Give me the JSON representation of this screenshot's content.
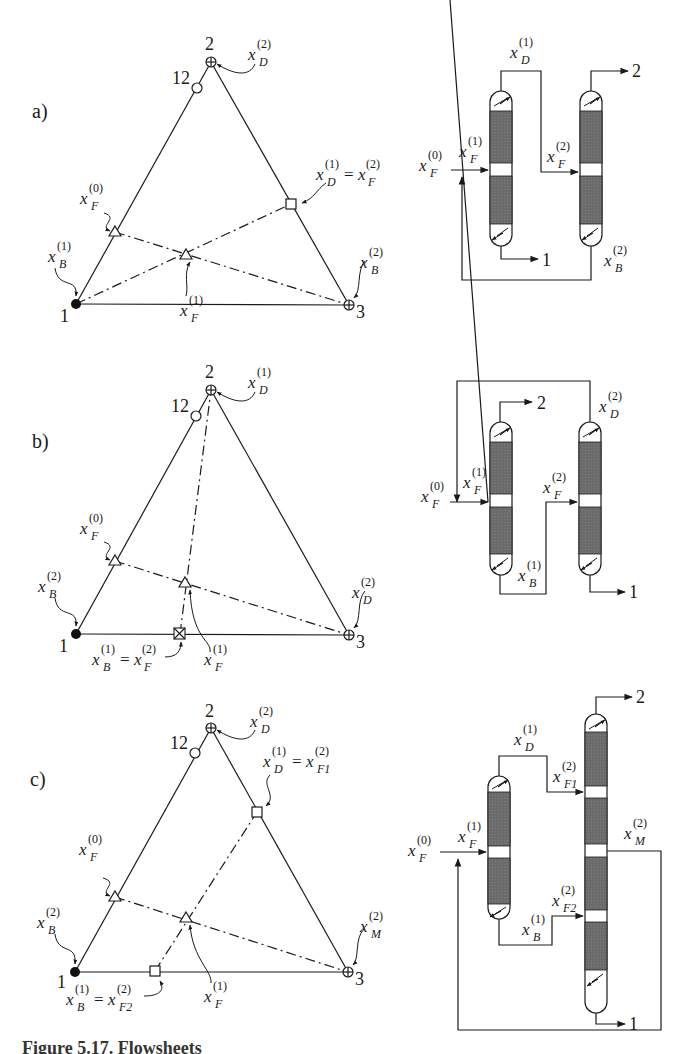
{
  "figure": {
    "caption": "Figure 5.17. Flowsheets"
  },
  "panels": [
    {
      "id": "a",
      "tag": "a)",
      "triangle": {
        "vertices": {
          "v1": "1",
          "v2": "2",
          "v3": "3",
          "azeotrope": "12"
        },
        "labels": {
          "top": "x_D^(2)",
          "right_mid": "x_D^(1) = x_F^(2)",
          "left_mid": "x_F^(0)",
          "bottom_left": "x_B^(1)",
          "bottom_right": "x_B^(2)",
          "center": "x_F^(1)"
        }
      },
      "flowsheet": {
        "labels": {
          "top_link": "x_D^(1)",
          "product_top": "2",
          "feed_fresh": "x_F^(0)",
          "feed_col1": "x_F^(1)",
          "feed_col2": "x_F^(2)",
          "product_bottom": "1",
          "recycle": "x_B^(2)"
        }
      }
    },
    {
      "id": "b",
      "tag": "b)",
      "triangle": {
        "vertices": {
          "v1": "1",
          "v2": "2",
          "v3": "3",
          "azeotrope": "12"
        },
        "labels": {
          "top": "x_D^(1)",
          "left_mid": "x_F^(0)",
          "bottom_left": "x_B^(2)",
          "bottom_right": "x_D^(2)",
          "center": "x_F^(1)",
          "bottom_mid": "x_B^(1) = x_F^(2)"
        }
      },
      "flowsheet": {
        "labels": {
          "product_top": "2",
          "recycle": "x_D^(2)",
          "feed_fresh": "x_F^(0)",
          "feed_col1": "x_F^(1)",
          "feed_col2": "x_F^(2)",
          "bottom_link": "x_B^(1)",
          "product_bottom": "1"
        }
      }
    },
    {
      "id": "c",
      "tag": "c)",
      "triangle": {
        "vertices": {
          "v1": "1",
          "v2": "2",
          "v3": "3",
          "azeotrope": "12"
        },
        "labels": {
          "top": "x_D^(2)",
          "right_mid": "x_D^(1) = x_F1^(2)",
          "left_mid": "x_F^(0)",
          "bottom_left": "x_B^(2)",
          "bottom_right": "x_M^(2)",
          "center": "x_F^(1)",
          "bottom_mid": "x_B^(1) = x_F2^(2)"
        }
      },
      "flowsheet": {
        "labels": {
          "top_link": "x_D^(1)",
          "feed_col2_upper": "x_F1^(2)",
          "product_top": "2",
          "feed_fresh": "x_F^(0)",
          "feed_col1": "x_F^(1)",
          "side_draw": "x_M^(2)",
          "feed_col2_lower": "x_F2^(2)",
          "bottom_link": "x_B^(1)",
          "product_bottom": "1"
        }
      }
    }
  ],
  "text": {
    "a_tag": "a)",
    "b_tag": "b)",
    "c_tag": "c)",
    "n1": "1",
    "n2": "2",
    "n3": "3",
    "n12": "12",
    "x": "x",
    "sup0": "(0)",
    "sup1": "(1)",
    "sup2": "(2)",
    "D": "D",
    "B": "B",
    "F": "F",
    "M": "M",
    "F1": "F1",
    "F2": "F2",
    "eq": "="
  },
  "colors": {
    "line": "#1a1a1a",
    "packing": "#6b6b6b",
    "background": "#ffffff"
  }
}
